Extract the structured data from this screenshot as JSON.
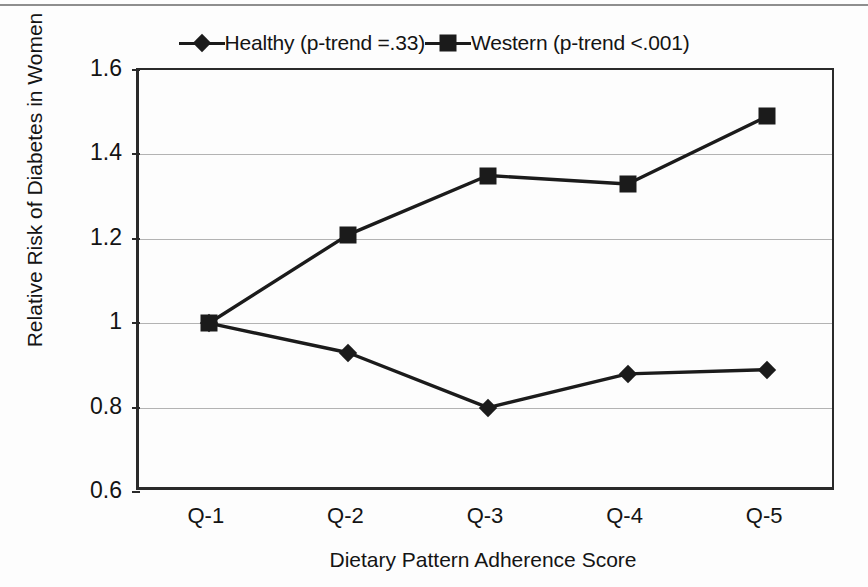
{
  "chart_data": {
    "type": "line",
    "title": "",
    "xlabel": "Dietary Pattern Adherence Score",
    "ylabel": "Relative Risk of Diabetes in Women",
    "categories": [
      "Q-1",
      "Q-2",
      "Q-3",
      "Q-4",
      "Q-5"
    ],
    "ylim": [
      0.6,
      1.6
    ],
    "yticks": [
      0.6,
      0.8,
      1.0,
      1.2,
      1.4,
      1.6
    ],
    "ytick_labels": [
      "0.6",
      "0.8",
      "1",
      "1.2",
      "1.4",
      "1.6"
    ],
    "grid": true,
    "legend_position": "top-center",
    "series": [
      {
        "name": "Healthy (p-trend =.33)",
        "marker": "diamond",
        "color": "#1b1b1b",
        "values": [
          1.0,
          0.93,
          0.8,
          0.88,
          0.89
        ]
      },
      {
        "name": "Western (p-trend <.001)",
        "marker": "square",
        "color": "#1b1b1b",
        "values": [
          1.0,
          1.21,
          1.35,
          1.33,
          1.49
        ]
      }
    ]
  },
  "legend": {
    "entries": [
      {
        "label": "Healthy (p-trend =.33)",
        "marker": "diamond-marker-icon"
      },
      {
        "label": "Western (p-trend <.001)",
        "marker": "square-marker-icon"
      }
    ]
  },
  "axes": {
    "y_title": "Relative Risk of Diabetes in Women",
    "x_title": "Dietary Pattern Adherence Score",
    "y_labels": [
      "1.6",
      "1.4",
      "1.2",
      "1",
      "0.8",
      "0.6"
    ],
    "x_labels": [
      "Q-1",
      "Q-2",
      "Q-3",
      "Q-4",
      "Q-5"
    ]
  },
  "colors": {
    "ink": "#1b1b1b",
    "axis": "#2a2a2a",
    "grid": "#b3b3b3",
    "background": "#fdfdfd"
  }
}
